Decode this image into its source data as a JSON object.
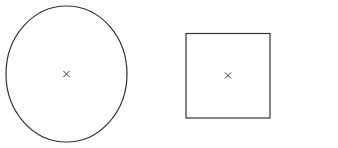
{
  "canvas": {
    "width": 338,
    "height": 148,
    "background": "#ffffff"
  },
  "shapes": [
    {
      "type": "ellipse",
      "name": "ellipse",
      "cx": 66.5,
      "cy": 74,
      "rx": 60.5,
      "ry": 68,
      "stroke": "#333333",
      "stroke_width": 1.2,
      "fill": "none",
      "center_marker": {
        "x": 66.5,
        "y": 74,
        "glyph": "×",
        "size": 3
      }
    },
    {
      "type": "rect",
      "name": "square",
      "x": 186,
      "y": 33.5,
      "width": 84,
      "height": 84.5,
      "stroke": "#333333",
      "stroke_width": 1.2,
      "fill": "none",
      "center_marker": {
        "x": 228,
        "y": 75.5,
        "glyph": "×",
        "size": 3
      }
    }
  ]
}
